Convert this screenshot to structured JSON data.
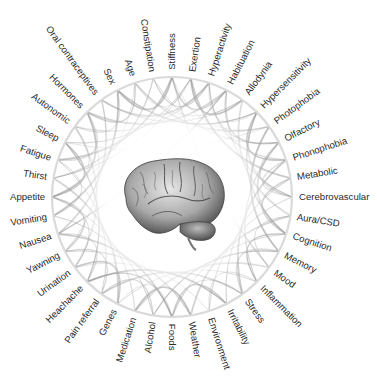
{
  "diagram": {
    "type": "circular-network",
    "center": {
      "x": 172,
      "y": 197
    },
    "radius": 120,
    "ring_color": "#d8d8d8",
    "chord_color": "#9a9a9a",
    "center_image": "brain-illustration",
    "labels": [
      {
        "text": "Stiffness",
        "angle": -90
      },
      {
        "text": "Exertion",
        "angle": -81
      },
      {
        "text": "Hyperactivity",
        "angle": -72
      },
      {
        "text": "Habituation",
        "angle": -63
      },
      {
        "text": "Allodynia",
        "angle": -54
      },
      {
        "text": "Hypersensitivity",
        "angle": -45
      },
      {
        "text": "Photophobia",
        "angle": -36
      },
      {
        "text": "Olfactory",
        "angle": -27
      },
      {
        "text": "Phonophobia",
        "angle": -18
      },
      {
        "text": "Metabolic",
        "angle": -9
      },
      {
        "text": "Cerebrovascular",
        "angle": 0
      },
      {
        "text": "Aura/CSD",
        "angle": 9
      },
      {
        "text": "Cognition",
        "angle": 18
      },
      {
        "text": "Memory",
        "angle": 27
      },
      {
        "text": "Mood",
        "angle": 36
      },
      {
        "text": "Inflammation",
        "angle": 45
      },
      {
        "text": "Stress",
        "angle": 54
      },
      {
        "text": "Irritability",
        "angle": 63
      },
      {
        "text": "Environment",
        "angle": 72
      },
      {
        "text": "Weather",
        "angle": 81
      },
      {
        "text": "Foods",
        "angle": 90
      },
      {
        "text": "Alcohol",
        "angle": 99
      },
      {
        "text": "Medication",
        "angle": 108
      },
      {
        "text": "Genes",
        "angle": 117
      },
      {
        "text": "Pain referral",
        "angle": 126
      },
      {
        "text": "Heachache",
        "angle": 135
      },
      {
        "text": "Urination",
        "angle": 144
      },
      {
        "text": "Yawning",
        "angle": 153
      },
      {
        "text": "Nausea",
        "angle": 162
      },
      {
        "text": "Vomiting",
        "angle": 171
      },
      {
        "text": "Appetite",
        "angle": 180
      },
      {
        "text": "Thirst",
        "angle": 189
      },
      {
        "text": "Fatigue",
        "angle": 198
      },
      {
        "text": "Sleep",
        "angle": 207
      },
      {
        "text": "Autonomic",
        "angle": 216
      },
      {
        "text": "Hormones",
        "angle": 225
      },
      {
        "text": "Oral contraceptives",
        "angle": 234
      },
      {
        "text": "Sex",
        "angle": 243
      },
      {
        "text": "Age",
        "angle": 252
      },
      {
        "text": "Constipation",
        "angle": 261
      }
    ],
    "chords": [
      [
        0,
        6
      ],
      [
        0,
        14
      ],
      [
        1,
        9
      ],
      [
        1,
        31
      ],
      [
        2,
        8
      ],
      [
        2,
        36
      ],
      [
        3,
        10
      ],
      [
        3,
        28
      ],
      [
        4,
        11
      ],
      [
        4,
        38
      ],
      [
        5,
        12
      ],
      [
        6,
        13
      ],
      [
        6,
        33
      ],
      [
        7,
        15
      ],
      [
        8,
        16
      ],
      [
        9,
        17
      ],
      [
        10,
        18
      ],
      [
        11,
        19
      ],
      [
        12,
        20
      ],
      [
        13,
        21
      ],
      [
        14,
        22
      ],
      [
        15,
        23
      ],
      [
        16,
        24
      ],
      [
        17,
        25
      ],
      [
        18,
        26
      ],
      [
        19,
        27
      ],
      [
        20,
        28
      ],
      [
        21,
        29
      ],
      [
        22,
        30
      ],
      [
        23,
        31
      ],
      [
        24,
        32
      ],
      [
        25,
        33
      ],
      [
        26,
        34
      ],
      [
        27,
        35
      ],
      [
        28,
        36
      ],
      [
        29,
        37
      ],
      [
        30,
        38
      ],
      [
        31,
        39
      ],
      [
        32,
        0
      ],
      [
        33,
        1
      ],
      [
        34,
        2
      ],
      [
        35,
        3
      ],
      [
        36,
        4
      ],
      [
        37,
        5
      ],
      [
        38,
        6
      ],
      [
        39,
        7
      ],
      [
        0,
        3
      ],
      [
        1,
        4
      ],
      [
        2,
        5
      ],
      [
        3,
        7
      ],
      [
        5,
        8
      ],
      [
        7,
        10
      ],
      [
        8,
        10
      ],
      [
        9,
        12
      ],
      [
        11,
        14
      ],
      [
        12,
        15
      ],
      [
        13,
        16
      ],
      [
        15,
        18
      ],
      [
        17,
        20
      ],
      [
        19,
        22
      ],
      [
        20,
        23
      ],
      [
        21,
        24
      ],
      [
        23,
        26
      ],
      [
        24,
        27
      ],
      [
        25,
        28
      ],
      [
        27,
        30
      ],
      [
        29,
        32
      ],
      [
        30,
        33
      ],
      [
        32,
        35
      ],
      [
        34,
        37
      ],
      [
        35,
        38
      ],
      [
        37,
        0
      ],
      [
        38,
        1
      ],
      [
        39,
        2
      ],
      [
        30,
        35
      ],
      [
        30,
        26
      ],
      [
        7,
        2
      ],
      [
        7,
        12
      ],
      [
        20,
        16
      ],
      [
        20,
        25
      ],
      [
        10,
        5
      ],
      [
        30,
        34
      ]
    ]
  }
}
